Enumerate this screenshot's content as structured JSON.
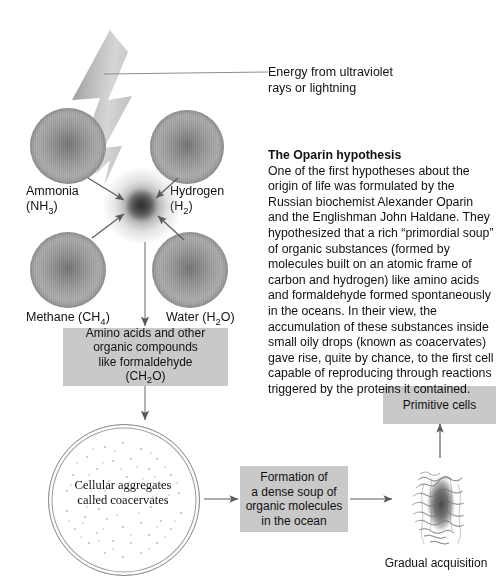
{
  "figure": {
    "molecules": [
      {
        "name": "ammonia",
        "label_line1": "Ammonia",
        "label_line2_pre": "(NH",
        "label_sub": "3",
        "label_line2_post": ")"
      },
      {
        "name": "hydrogen",
        "label_line1": "Hydrogen",
        "label_line2_pre": "(H",
        "label_sub": "2",
        "label_line2_post": ")"
      },
      {
        "name": "methane",
        "label_line1": "Methane (CH",
        "label_sub": "4",
        "label_line2_post": ")"
      },
      {
        "name": "water",
        "label_line1": "Water (H",
        "label_sub": "2",
        "label_line2_post": "O)"
      }
    ],
    "energy_callout": "Energy from ultraviolet\nrays or lightning",
    "energy_callout_line1": "Energy from ultraviolet",
    "energy_callout_line2": "rays or lightning",
    "box_amino": {
      "line1": "Amino acids and other",
      "line2": "organic compounds",
      "line3": "like formaldehyde",
      "line4_pre": "(CH",
      "line4_sub": "2",
      "line4_post": "O)"
    },
    "coacervate": {
      "line1": "Cellular aggregates",
      "line2": "called coacervates"
    },
    "box_soup": {
      "line1": "Formation of",
      "line2": "a dense soup of",
      "line3": "organic molecules",
      "line4": "in the ocean"
    },
    "box_primitive": "Primitive cells",
    "caption_bottom": "Gradual acquisition"
  },
  "article": {
    "title": "The Oparin hypothesis",
    "paragraph": "One of the first hypotheses about the origin of life was formulated by the Russian biochemist Alexander Oparin and the Englishman John Haldane. They hypothesized that a rich “primordial soup” of organic substances (formed by molecules built on an atomic frame of carbon and hydrogen) like amino acids and formaldehyde formed spontaneously in the oceans. In their view, the accumulation of these substances inside small oily drops (known as coacervates) gave rise, quite by chance, to the first cell capable of reproducing through reactions triggered by the proteins it contained."
  },
  "colors": {
    "box_gray": "#c9c9c9",
    "sphere_gray": "#9a9a9a",
    "arrow": "#5a5a5a",
    "text": "#111111"
  }
}
